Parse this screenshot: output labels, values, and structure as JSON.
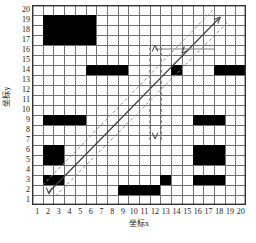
{
  "figure": {
    "kind": "grid-map",
    "background": "#ffffff",
    "ink": "#1a1a1a"
  },
  "axes": {
    "x_title": "坐标x",
    "y_title": "坐标y",
    "x_ticks": [
      1,
      2,
      3,
      4,
      5,
      6,
      7,
      8,
      9,
      10,
      11,
      12,
      13,
      14,
      15,
      16,
      17,
      18,
      19,
      20
    ],
    "y_ticks": [
      1,
      2,
      3,
      4,
      5,
      6,
      7,
      8,
      9,
      10,
      11,
      12,
      13,
      14,
      15,
      16,
      17,
      18,
      19,
      20
    ],
    "x_range": [
      0,
      20
    ],
    "y_range": [
      0,
      20
    ],
    "grid": true,
    "grid_color": "#707070",
    "border_color": "#303030"
  },
  "chart_data": {
    "type": "heatmap",
    "title": "",
    "xlabel": "坐标x",
    "ylabel": "坐标y",
    "xlim": [
      0,
      20
    ],
    "ylim": [
      0,
      20
    ],
    "grid": true,
    "legend": "none",
    "cell_size": 1,
    "obstacle_color": "#000000",
    "free_color": "#ffffff",
    "obstacle_rects": [
      {
        "x0": 1,
        "y0": 16,
        "x1": 6,
        "y1": 19
      },
      {
        "x0": 5,
        "y0": 13,
        "x1": 9,
        "y1": 14
      },
      {
        "x0": 13,
        "y0": 13,
        "x1": 14,
        "y1": 14
      },
      {
        "x0": 17,
        "y0": 13,
        "x1": 20,
        "y1": 14
      },
      {
        "x0": 1,
        "y0": 8,
        "x1": 5,
        "y1": 9
      },
      {
        "x0": 15,
        "y0": 8,
        "x1": 18,
        "y1": 9
      },
      {
        "x0": 1,
        "y0": 4,
        "x1": 3,
        "y1": 6
      },
      {
        "x0": 15,
        "y0": 4,
        "x1": 18,
        "y1": 6
      },
      {
        "x0": 1,
        "y0": 2,
        "x1": 3,
        "y1": 3
      },
      {
        "x0": 15,
        "y0": 2,
        "x1": 18,
        "y1": 3
      },
      {
        "x0": 12,
        "y0": 2,
        "x1": 13,
        "y1": 3
      },
      {
        "x0": 8,
        "y0": 1,
        "x1": 12,
        "y1": 2
      }
    ],
    "paths": [
      {
        "name": "main-diagonal-corridor",
        "style": "solid",
        "color": "#404040",
        "points": [
          [
            1.5,
            1.2
          ],
          [
            17.6,
            18.8
          ]
        ]
      },
      {
        "name": "corridor-boundary-upper",
        "style": "dashed",
        "color": "#8a8a8a",
        "points": [
          [
            1.0,
            2.0
          ],
          [
            17.0,
            19.6
          ]
        ]
      },
      {
        "name": "corridor-boundary-lower",
        "style": "dashed",
        "color": "#8a8a8a",
        "points": [
          [
            2.2,
            0.9
          ],
          [
            18.4,
            18.4
          ]
        ]
      },
      {
        "name": "vertical-branch-corridor",
        "style": "dashed",
        "color": "#8a8a8a",
        "points": [
          [
            11.0,
            6.5
          ],
          [
            11.0,
            16.0
          ]
        ]
      },
      {
        "name": "vertical-branch-corridor-right",
        "style": "dashed",
        "color": "#8a8a8a",
        "points": [
          [
            12.1,
            6.5
          ],
          [
            12.1,
            16.0
          ]
        ]
      },
      {
        "name": "horizontal-link",
        "style": "solid",
        "color": "#808080",
        "points": [
          [
            11.5,
            15.6
          ],
          [
            17.0,
            15.6
          ]
        ]
      }
    ],
    "arrows": [
      {
        "name": "goal-arrow-top-right",
        "at": [
          17.6,
          18.8
        ],
        "dir": "up-right"
      },
      {
        "name": "branch-arrow-upper",
        "at": [
          11.5,
          16.0
        ],
        "dir": "up"
      },
      {
        "name": "branch-arrow-lower",
        "at": [
          11.5,
          6.6
        ],
        "dir": "down"
      },
      {
        "name": "start-arrow-origin",
        "at": [
          1.6,
          1.1
        ],
        "dir": "down"
      },
      {
        "name": "mid-arrow-down",
        "at": [
          14.0,
          15.2
        ],
        "dir": "down-left"
      }
    ]
  }
}
